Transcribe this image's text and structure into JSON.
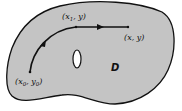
{
  "diagram": {
    "region_label": "D",
    "start_point": {
      "x": "x",
      "x_sub": "0",
      "y": "y",
      "y_sub": "0"
    },
    "mid_point": {
      "x": "x",
      "x_sub": "1",
      "y": "y"
    },
    "end_point": {
      "x": "x",
      "y": "y"
    },
    "colors": {
      "region_fill": "#c4c4c4",
      "outline": "#111111",
      "hole_fill": "#ffffff"
    }
  }
}
